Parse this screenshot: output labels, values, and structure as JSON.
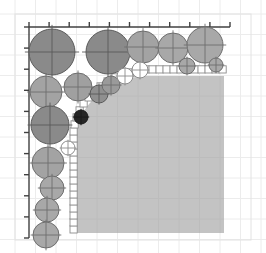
{
  "figure": {
    "title": "",
    "background_color": "#ffffff",
    "frame": {
      "x": 15,
      "y": 14,
      "width": 236,
      "height": 226,
      "border_color": "#e2e2e2",
      "grid_color": "#ececec",
      "grid_spacing": 20.5
    },
    "axes": {
      "axis_color": "#404040",
      "top_axis": {
        "x1": 29,
        "x2": 230,
        "y": 27,
        "tick_length": 5,
        "tick_count": 11
      },
      "left_axis": {
        "y1": 27,
        "y2": 238,
        "x": 29,
        "tick_length": 5,
        "tick_count": 11
      }
    },
    "region": {
      "label": "filled-quarter-disc",
      "fill_color": "#c3c3c3",
      "grid_color": "#bcbcbc",
      "right_edge": 224,
      "bottom_edge": 233,
      "corner_center_x": 148,
      "corner_center_y": 152,
      "corner_radius": 76
    },
    "staircase": {
      "label": "boundary-cell-outline",
      "cell_size": 7.2,
      "stroke_color": "#8c8c8c",
      "fill_color": "#ffffff",
      "cells": [
        [
          70,
          233
        ],
        [
          70,
          226
        ],
        [
          70,
          219
        ],
        [
          70,
          212
        ],
        [
          70,
          205
        ],
        [
          70,
          198
        ],
        [
          70,
          191
        ],
        [
          70,
          184
        ],
        [
          70,
          177
        ],
        [
          70,
          170
        ],
        [
          70,
          163
        ],
        [
          70,
          156
        ],
        [
          70,
          149
        ],
        [
          70,
          142
        ],
        [
          70,
          135
        ],
        [
          71,
          128
        ],
        [
          73,
          121
        ],
        [
          76,
          114
        ],
        [
          80,
          107
        ],
        [
          85,
          101
        ],
        [
          91,
          95
        ],
        [
          97,
          90
        ],
        [
          104,
          85
        ],
        [
          112,
          81
        ],
        [
          120,
          78
        ],
        [
          128,
          76
        ],
        [
          135,
          74
        ],
        [
          142,
          73
        ],
        [
          149,
          73
        ],
        [
          156,
          73
        ],
        [
          163,
          73
        ],
        [
          170,
          73
        ],
        [
          177,
          73
        ],
        [
          184,
          73
        ],
        [
          191,
          73
        ],
        [
          198,
          73
        ],
        [
          205,
          73
        ],
        [
          212,
          73
        ],
        [
          219,
          73
        ]
      ]
    },
    "circles": [
      {
        "cx": 52,
        "cy": 52,
        "r": 23,
        "fill": "#8a8a8a",
        "stroke": "#5a5a5a",
        "crosshair": true
      },
      {
        "cx": 108,
        "cy": 52,
        "r": 22,
        "fill": "#8a8a8a",
        "stroke": "#5a5a5a",
        "crosshair": true
      },
      {
        "cx": 143,
        "cy": 47,
        "r": 16,
        "fill": "#a3a3a3",
        "stroke": "#6e6e6e",
        "crosshair": true
      },
      {
        "cx": 173,
        "cy": 48,
        "r": 15,
        "fill": "#a8a8a8",
        "stroke": "#6e6e6e",
        "crosshair": true
      },
      {
        "cx": 205,
        "cy": 45,
        "r": 18,
        "fill": "#a8a8a8",
        "stroke": "#6e6e6e",
        "crosshair": true
      },
      {
        "cx": 187,
        "cy": 66,
        "r": 8,
        "fill": "#a8a8a8",
        "stroke": "#6e6e6e",
        "crosshair": true
      },
      {
        "cx": 216,
        "cy": 65,
        "r": 7,
        "fill": "#a8a8a8",
        "stroke": "#6e6e6e",
        "crosshair": true
      },
      {
        "cx": 46,
        "cy": 92,
        "r": 16,
        "fill": "#a3a3a3",
        "stroke": "#6e6e6e",
        "crosshair": true
      },
      {
        "cx": 78,
        "cy": 87,
        "r": 14,
        "fill": "#a0a0a0",
        "stroke": "#6e6e6e",
        "crosshair": true
      },
      {
        "cx": 99,
        "cy": 94,
        "r": 9,
        "fill": "#8f8f8f",
        "stroke": "#5a5a5a",
        "crosshair": true
      },
      {
        "cx": 111,
        "cy": 85,
        "r": 9,
        "fill": "#9a9a9a",
        "stroke": "#6e6e6e",
        "crosshair": true
      },
      {
        "cx": 125,
        "cy": 76,
        "r": 8,
        "fill": "#ffffff",
        "stroke": "#8c8c8c",
        "crosshair": true
      },
      {
        "cx": 140,
        "cy": 70,
        "r": 8,
        "fill": "#ffffff",
        "stroke": "#8c8c8c",
        "crosshair": true
      },
      {
        "cx": 50,
        "cy": 125,
        "r": 19,
        "fill": "#8a8a8a",
        "stroke": "#5a5a5a",
        "crosshair": true
      },
      {
        "cx": 81,
        "cy": 117,
        "r": 7,
        "fill": "#262626",
        "stroke": "#1a1a1a",
        "crosshair": true
      },
      {
        "cx": 48,
        "cy": 163,
        "r": 16,
        "fill": "#a3a3a3",
        "stroke": "#6e6e6e",
        "crosshair": true
      },
      {
        "cx": 68,
        "cy": 148,
        "r": 7,
        "fill": "#ffffff",
        "stroke": "#8c8c8c",
        "crosshair": true
      },
      {
        "cx": 52,
        "cy": 188,
        "r": 12,
        "fill": "#a8a8a8",
        "stroke": "#6e6e6e",
        "crosshair": true
      },
      {
        "cx": 47,
        "cy": 210,
        "r": 12,
        "fill": "#a8a8a8",
        "stroke": "#6e6e6e",
        "crosshair": true
      },
      {
        "cx": 46,
        "cy": 235,
        "r": 13,
        "fill": "#a8a8a8",
        "stroke": "#6e6e6e",
        "crosshair": true
      }
    ]
  }
}
